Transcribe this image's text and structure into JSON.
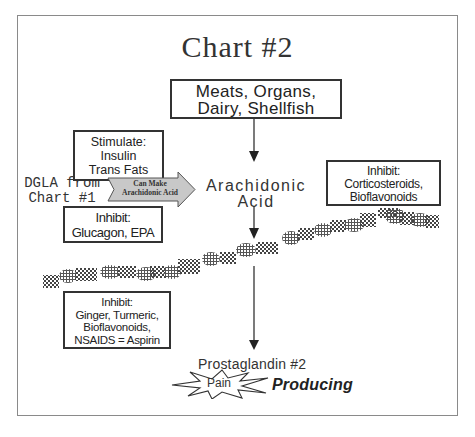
{
  "diagram": {
    "title": "Chart #2",
    "source_box": {
      "line1": "Meats, Organs,",
      "line2": "Dairy, Shellfish"
    },
    "stimulate_box": {
      "heading": "Stimulate:",
      "line1": "Insulin",
      "line2": "Trans Fats"
    },
    "dgla_label": {
      "line1": "DGLA from",
      "line2": "Chart #1"
    },
    "conversion_arrow": {
      "line1": "Can Make",
      "line2": "Arachidonic Acid"
    },
    "central_node": {
      "line1": "Arachidonic",
      "line2": "Acid"
    },
    "inhibit_glucagon_box": {
      "heading": "Inhibit:",
      "line1": "Glucagon, EPA"
    },
    "inhibit_corticosteroids_box": {
      "heading": "Inhibit:",
      "line1": "Corticosteroids,",
      "line2": "Bioflavonoids"
    },
    "inhibit_ginger_box": {
      "heading": "Inhibit:",
      "line1": "Ginger, Turmeric,",
      "line2": "Bioflavonoids,",
      "line3": "NSAIDS = Aspirin"
    },
    "output_node": {
      "label": "Prostaglandin #2",
      "burst_label": "Pain",
      "suffix": "Producing"
    },
    "colors": {
      "frame": "#8a8a8a",
      "text": "#222222",
      "arrow_fill": "#c8c8c8",
      "pattern": "#555555"
    }
  }
}
